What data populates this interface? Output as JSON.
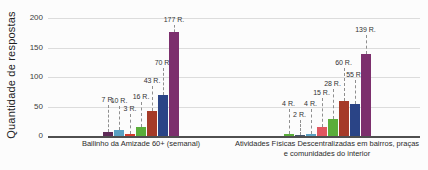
{
  "chart_data": {
    "type": "bar",
    "title": "",
    "ylabel": "Quantidade de respostas",
    "xlabel": "",
    "ylim": [
      0,
      200
    ],
    "yticks": [
      0,
      50,
      100,
      150,
      200
    ],
    "grid": true,
    "legend": "none",
    "value_label_suffix": "R.",
    "groups": [
      {
        "category": "Bailinho da Amizade 60+ (semanal)",
        "bars": [
          {
            "value": 7,
            "label": "7 R.",
            "color": "#5e2a57",
            "leader": 29
          },
          {
            "value": 10,
            "label": "10 R.",
            "color": "#5aa0c2",
            "leader": 26
          },
          {
            "value": 3,
            "label": "3 R.",
            "color": "#d23b2c",
            "leader": 22
          },
          {
            "value": 16,
            "label": "16 R.",
            "color": "#5aad3a",
            "leader": 27
          },
          {
            "value": 43,
            "label": "43 R.",
            "color": "#a53a28",
            "leader": 27
          },
          {
            "value": 70,
            "label": "70 R.",
            "color": "#2a4486",
            "leader": 29
          },
          {
            "value": 177,
            "label": "177 R.",
            "color": "#7c2f6d",
            "leader": 9
          }
        ]
      },
      {
        "category": "Atividades Físicas Descentralizadas em bairros, praças e comunidades do interior",
        "bars": [
          {
            "value": 4,
            "label": "4 R.",
            "color": "#5aad3a",
            "leader": 27
          },
          {
            "value": 2,
            "label": "2 R.",
            "color": "#44546a",
            "leader": 17
          },
          {
            "value": 4,
            "label": "4 R.",
            "color": "#5aa0c2",
            "leader": 27
          },
          {
            "value": 15,
            "label": "15 R.",
            "color": "#e0565f",
            "leader": 31
          },
          {
            "value": 28,
            "label": "28 R.",
            "color": "#5aad3a",
            "leader": 32
          },
          {
            "value": 60,
            "label": "60 R.",
            "color": "#a53a28",
            "leader": 35
          },
          {
            "value": 55,
            "label": "55 R.",
            "color": "#2a4486",
            "leader": 26
          },
          {
            "value": 139,
            "label": "139 R.",
            "color": "#7c2f6d",
            "leader": 21
          }
        ]
      }
    ],
    "palette": {
      "gridline": "#dcdcdc",
      "axis": "#4f4f4f",
      "leader_line": "#8f8f8f",
      "text": "#333333",
      "background": "#fcfcfc"
    }
  }
}
